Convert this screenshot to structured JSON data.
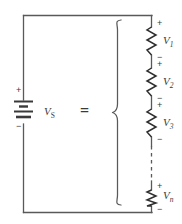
{
  "figure": {
    "type": "circuit-diagram",
    "stroke_color": "#595959",
    "text_color": "#3a3a3a",
    "background": "#ffffff"
  },
  "source": {
    "name": "voltage-source",
    "symbol": "battery",
    "label": "V",
    "subscript": "S",
    "plus_sign": "+",
    "minus_sign": "−"
  },
  "equals": {
    "label": "="
  },
  "brace": {
    "name": "curly-brace",
    "orientation": "left-pointing"
  },
  "elements": [
    {
      "name": "resistor-1",
      "label": "V",
      "subscript": "1",
      "plus_sign": "+",
      "minus_sign": "−"
    },
    {
      "name": "resistor-2",
      "label": "V",
      "subscript": "2",
      "plus_sign": "+",
      "minus_sign": "−"
    },
    {
      "name": "resistor-3",
      "label": "V",
      "subscript": "3",
      "plus_sign": "+",
      "minus_sign": "−"
    },
    {
      "name": "resistor-n",
      "label": "V",
      "subscript": "n",
      "plus_sign": "+",
      "minus_sign": "−"
    }
  ],
  "continuation": {
    "name": "dashed-continuation",
    "style": "dashed"
  }
}
